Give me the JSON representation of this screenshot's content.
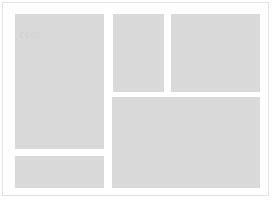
{
  "page": {
    "background_color": "#ffffff",
    "frame_border_color": "#e3e3e3",
    "skeleton_color": "#d9d9d9",
    "ghost_text_color": "#d4d4d4"
  },
  "skeleton": {
    "state_label": "loading",
    "blocks": [
      {
        "id": "block-primary",
        "name": "primary-content-placeholder",
        "ghost_label": "EDIT"
      },
      {
        "id": "block-secondary",
        "name": "secondary-content-placeholder",
        "ghost_label": ""
      },
      {
        "id": "block-tertiary",
        "name": "tertiary-content-placeholder",
        "ghost_label": ""
      },
      {
        "id": "block-feature",
        "name": "feature-content-placeholder",
        "ghost_label": ""
      },
      {
        "id": "block-footer",
        "name": "footer-content-placeholder",
        "ghost_label": ""
      }
    ]
  }
}
